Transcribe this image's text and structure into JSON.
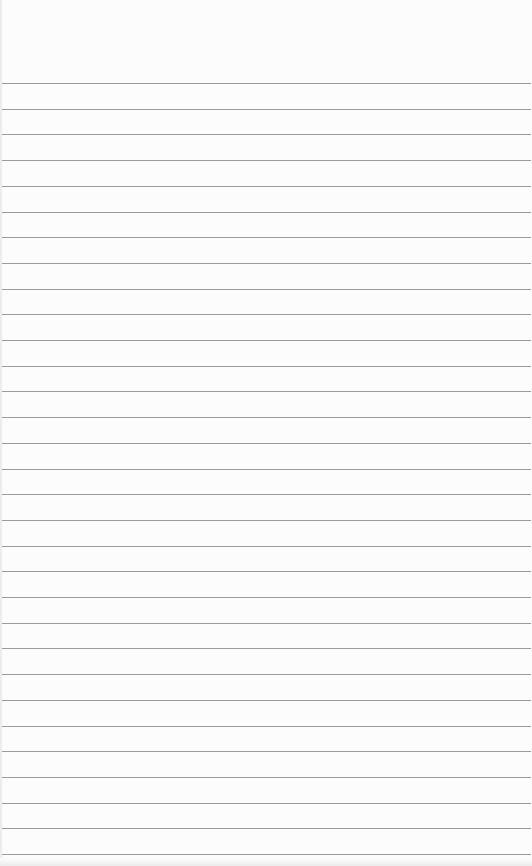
{
  "paper": {
    "type": "lined-notepad",
    "background_color": "#fcfcfc",
    "line_color": "#9a9a9a",
    "first_line_y": 83,
    "line_spacing": 25.7,
    "line_count": 31
  }
}
